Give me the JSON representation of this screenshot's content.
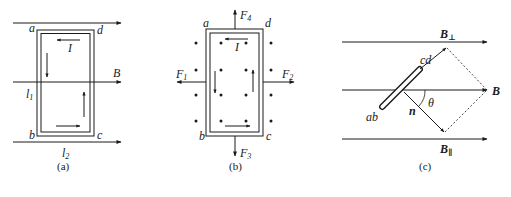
{
  "panels": {
    "a": {
      "caption": "(a)",
      "corners": {
        "a": "a",
        "b": "b",
        "c": "c",
        "d": "d"
      },
      "current_label": "I",
      "field_label": "B",
      "l1": {
        "main": "l",
        "sub": "1"
      },
      "l2": {
        "main": "l",
        "sub": "2"
      }
    },
    "b": {
      "caption": "(b)",
      "corners": {
        "a": "a",
        "b": "b",
        "c": "c",
        "d": "d"
      },
      "current_label": "I",
      "forces": {
        "F1": {
          "main": "F",
          "sub": "1"
        },
        "F2": {
          "main": "F",
          "sub": "2"
        },
        "F3": {
          "main": "F",
          "sub": "3"
        },
        "F4": {
          "main": "F",
          "sub": "4"
        }
      }
    },
    "c": {
      "caption": "(c)",
      "field_label": "B",
      "b_perp": {
        "main": "B",
        "sub": "⊥"
      },
      "b_par": {
        "main": "B",
        "sub": "∥"
      },
      "coil_end_top": "cd",
      "coil_end_bottom": "ab",
      "normal_label": "n",
      "angle_label": "θ"
    }
  },
  "colors": {
    "stroke": "#1a1a1a",
    "background": "#ffffff"
  }
}
